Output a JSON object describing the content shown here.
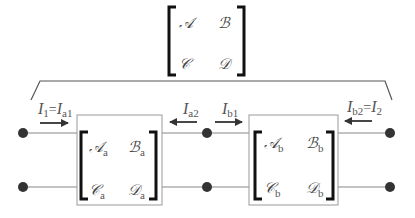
{
  "diagram": {
    "type": "cascaded two-port networks",
    "overall_matrix": {
      "entries": [
        "𝒜",
        "ℬ",
        "𝒞",
        "𝒟"
      ]
    },
    "network_a": {
      "entries": {
        "A": "𝒜",
        "B": "ℬ",
        "C": "𝒞",
        "D": "𝒟"
      },
      "subscript": "a"
    },
    "network_b": {
      "entries": {
        "A": "𝒜",
        "B": "ℬ",
        "C": "𝒞",
        "D": "𝒟"
      },
      "subscript": "b"
    },
    "currents": {
      "i1": {
        "main": "I",
        "sub1": "1",
        "eq": "=",
        "main2": "I",
        "sub2": "a1",
        "direction": "right"
      },
      "ia2": {
        "main": "I",
        "sub": "a2",
        "direction": "left"
      },
      "ib1": {
        "main": "I",
        "sub": "b1",
        "direction": "right"
      },
      "i2": {
        "main": "I",
        "sub1": "b2",
        "eq": "=",
        "main2": "I",
        "sub2": "2",
        "direction": "left"
      }
    },
    "colors": {
      "wire": "#888888",
      "node": "#333333",
      "bracket": "#111111",
      "text": "#555555",
      "box_border": "#999999"
    }
  }
}
